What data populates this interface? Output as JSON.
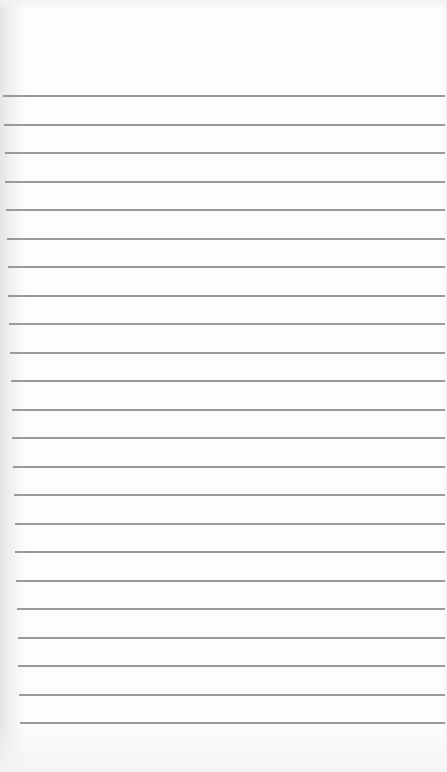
{
  "page": {
    "type": "lined-notepad",
    "background_color": "#fdfdfd",
    "rule_color": "#8f8f8f",
    "rule_count": 23,
    "first_rule_y": 95,
    "rule_spacing": 28.5,
    "text_lines": []
  }
}
